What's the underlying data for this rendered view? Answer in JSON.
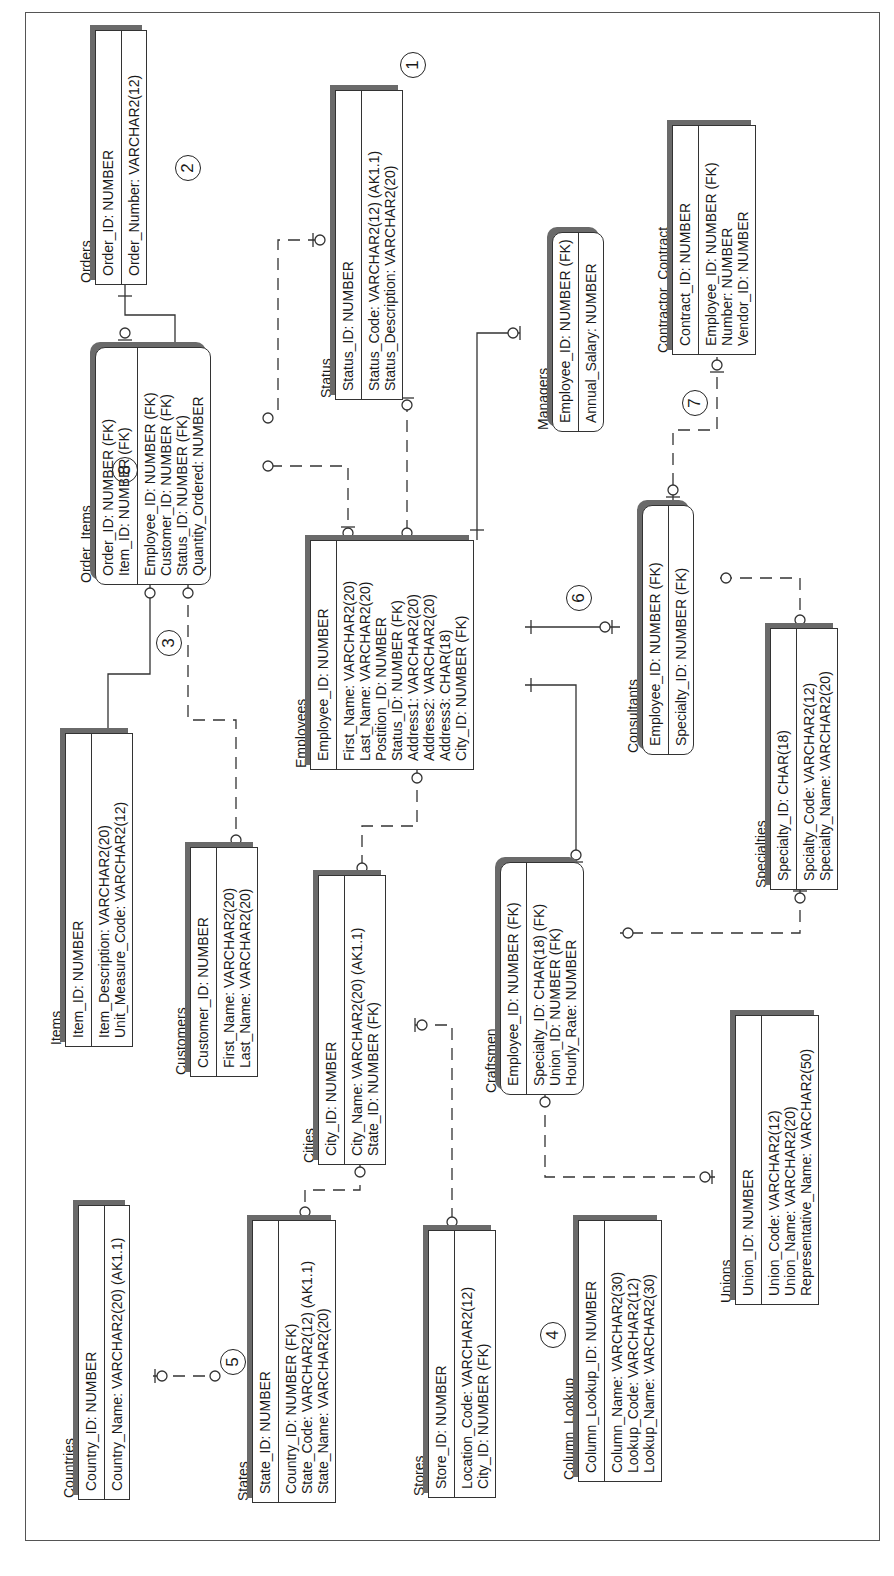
{
  "diagram": {
    "type": "entity-relationship",
    "orientation": "rotated-90-ccw"
  },
  "entities": {
    "orders": {
      "name": "Orders",
      "pk": [
        "Order_ID: NUMBER"
      ],
      "attrs": [
        "Order_Number: VARCHAR2(12)"
      ]
    },
    "status": {
      "name": "Status",
      "pk": [
        "Status_ID: NUMBER"
      ],
      "attrs": [
        "Status_Code: VARCHAR2(12) (AK1.1)",
        "Status_Description: VARCHAR2(20)"
      ]
    },
    "contractor_contract": {
      "name": "Contractor_Contract",
      "pk": [
        "Contract_ID: NUMBER"
      ],
      "attrs": [
        "Employee_ID: NUMBER (FK)",
        "Number: NUMBER",
        "Vendor_ID: NUMBER"
      ]
    },
    "managers": {
      "name": "Managers",
      "pk": [
        "Employee_ID: NUMBER (FK)"
      ],
      "attrs": [
        "Annual_Salary: NUMBER"
      ]
    },
    "order_items": {
      "name": "Order_Items",
      "pk": [
        "Order_ID: NUMBER (FK)",
        "Item_ID: NUMBER (FK)"
      ],
      "attrs": [
        "Employee_ID: NUMBER (FK)",
        "Customer_ID: NUMBER (FK)",
        "Status_ID: NUMBER (FK)",
        "Quantity_Ordered: NUMBER"
      ]
    },
    "employees": {
      "name": "Employees",
      "pk": [
        "Employee_ID: NUMBER"
      ],
      "attrs": [
        "First_Name: VARCHAR2(20)",
        "Last_Name: VARCHAR2(20)",
        "Postition_ID: NUMBER",
        "Status_ID: NUMBER (FK)",
        "Address1: VARCHAR2(20)",
        "Address2: VARCHAR2(20)",
        "Address3: CHAR(18)",
        "City_ID: NUMBER (FK)"
      ]
    },
    "consultants": {
      "name": "Consultants",
      "pk": [
        "Employee_ID: NUMBER (FK)"
      ],
      "attrs": [
        "Specialty_ID: NUMBER (FK)"
      ]
    },
    "specialties": {
      "name": "Specialties",
      "pk": [
        "Specialty_ID: CHAR(18)"
      ],
      "attrs": [
        "Spcialty_Code: VARCHAR2(12)",
        "Specialty_Name: VARCHAR2(20)"
      ]
    },
    "items": {
      "name": "Items",
      "pk": [
        "Item_ID: NUMBER"
      ],
      "attrs": [
        "Item_Description: VARCHAR2(20)",
        "Unit_Measure_Code: VARCHAR2(12)"
      ]
    },
    "customers": {
      "name": "Customers",
      "pk": [
        "Customer_ID: NUMBER"
      ],
      "attrs": [
        "First_Name: VARCHAR2(20)",
        "Last_Name: VARCHAR2(20)"
      ]
    },
    "cities": {
      "name": "Cities",
      "pk": [
        "City_ID: NUMBER"
      ],
      "attrs": [
        "City_Name: VARCHAR2(20) (AK1.1)",
        "State_ID: NUMBER (FK)"
      ]
    },
    "craftsmen": {
      "name": "Craftsmen",
      "pk": [
        "Employee_ID: NUMBER (FK)"
      ],
      "attrs": [
        "Specialty_ID: CHAR(18) (FK)",
        "Union_ID: NUMBER (FK)",
        "Hourly_Rate: NUMBER"
      ]
    },
    "unions": {
      "name": "Unions",
      "pk": [
        "Union_ID: NUMBER"
      ],
      "attrs": [
        "Union_Code: VARCHAR2(12)",
        "Union_Name: VARCHAR2(20)",
        "Representative_Name: VARCHAR2(50)"
      ]
    },
    "countries": {
      "name": "Countries",
      "pk": [
        "Country_ID: NUMBER"
      ],
      "attrs": [
        "Country_Name: VARCHAR2(20) (AK1.1)"
      ]
    },
    "states": {
      "name": "States",
      "pk": [
        "State_ID: NUMBER"
      ],
      "attrs": [
        "Country_ID: NUMBER (FK)",
        "State_Code: VARCHAR2(12) (AK1.1)",
        "State_Name: VARCHAR2(20)"
      ]
    },
    "stores": {
      "name": "Stores",
      "pk": [
        "Store_ID: NUMBER"
      ],
      "attrs": [
        "Location_Code: VARCHAR2(12)",
        "City_ID: NUMBER (FK)"
      ]
    },
    "column_lookup": {
      "name": "Column_Lookup",
      "pk": [
        "Column_Lookup_ID: NUMBER"
      ],
      "attrs": [
        "Column_Name: VARCHAR2(30)",
        "Lookup_Code: VARCHAR2(12)",
        "Lookup_Name: VARCHAR2(30)"
      ]
    }
  },
  "callouts": [
    "1",
    "2",
    "3",
    "4",
    "5",
    "6",
    "7",
    "8"
  ],
  "colors": {
    "line": "#333333",
    "shadow": "#6a6a6a",
    "background": "#ffffff"
  }
}
